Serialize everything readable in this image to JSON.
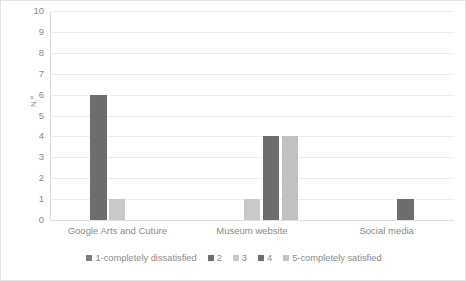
{
  "chart_data": {
    "type": "bar",
    "title": "",
    "subtitle": "",
    "xlabel": "",
    "ylabel": "N.º",
    "ylim": [
      0,
      10
    ],
    "ytick_step": 1,
    "yticks": [
      "10",
      "9",
      "8",
      "7",
      "6",
      "5",
      "4",
      "3",
      "2",
      "1",
      "0"
    ],
    "grid": true,
    "legend_position": "bottom",
    "categories": [
      "Google Arts and Cuture",
      "Museum website",
      "Social media"
    ],
    "series": [
      {
        "name": "1-completely dissatisfied",
        "color": "#7f7f7f",
        "values": [
          0,
          0,
          0
        ]
      },
      {
        "name": "2",
        "color": "#6e6e6e",
        "values": [
          6,
          0,
          0
        ]
      },
      {
        "name": "3",
        "color": "#c9c9c9",
        "values": [
          1,
          1,
          0
        ]
      },
      {
        "name": "4",
        "color": "#6e6e6e",
        "values": [
          0,
          4,
          1
        ]
      },
      {
        "name": "5-completely satisfied",
        "color": "#c2c2c2",
        "values": [
          0,
          4,
          0
        ]
      }
    ]
  },
  "colors": {
    "gridline": "#ededed",
    "axis": "#d9d9d9",
    "text": "#8a8a8a",
    "background": "#ffffff",
    "border": "#e3e3e3"
  }
}
